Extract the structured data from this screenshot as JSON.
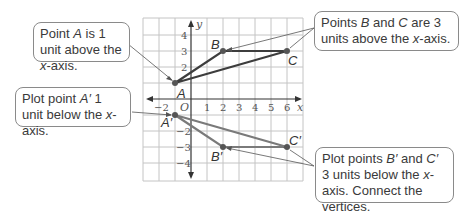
{
  "callouts": {
    "a": {
      "pre": "Point ",
      "var": "A",
      "mid": " is 1 unit above the ",
      "var2": "x",
      "post": "-axis."
    },
    "bc": {
      "pre": "Points ",
      "var": "B",
      "mid": " and ",
      "var2": "C",
      "post": " are 3 units above the ",
      "var3": "x",
      "post2": "-axis."
    },
    "a_prime": {
      "pre": "Plot point ",
      "var": "A′",
      "mid": " 1 unit below the ",
      "var2": "x",
      "post": "-axis."
    },
    "bc_prime": {
      "pre": "Plot points ",
      "var": "B′",
      "mid": " and ",
      "var2": "C′",
      "post": " 3 units below the ",
      "var3": "x",
      "post2": "-axis. Connect the vertices."
    }
  },
  "axes": {
    "x_label": "x",
    "y_label": "y",
    "origin_label": "O",
    "x_ticks": [
      "−2",
      "1",
      "2",
      "3",
      "4",
      "5",
      "6"
    ],
    "y_ticks": [
      "4",
      "3",
      "2",
      "−2",
      "−3",
      "−4"
    ]
  },
  "points": {
    "A": {
      "label": "A",
      "x": -1,
      "y": 1
    },
    "B": {
      "label": "B",
      "x": 2,
      "y": 3
    },
    "C": {
      "label": "C",
      "x": 6,
      "y": 3
    },
    "A_prime": {
      "label": "A′",
      "x": -1,
      "y": -1
    },
    "B_prime": {
      "label": "B′",
      "x": 2,
      "y": -3
    },
    "C_prime": {
      "label": "C′",
      "x": 6,
      "y": -3
    }
  },
  "colors": {
    "triangle": "#4a4a4a",
    "reflected": "#7a7a7a",
    "grid": "#bdbdbd",
    "axis": "#333333"
  }
}
